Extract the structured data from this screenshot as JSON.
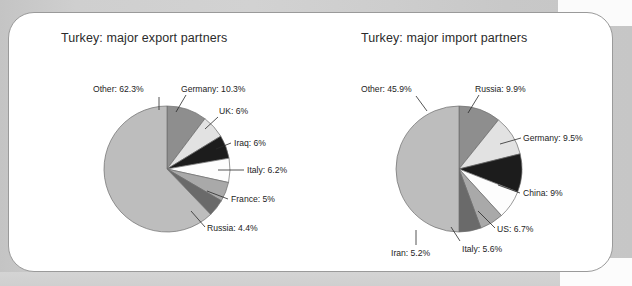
{
  "page": {
    "background_color": "#cdcdcd",
    "card_color": "#ffffff",
    "card_border_color": "#9a9a9a"
  },
  "charts": [
    {
      "id": "export",
      "title": "Turkey: major export partners",
      "chart_data": {
        "type": "pie",
        "title": "Turkey: major export partners",
        "xlabel": "",
        "ylabel": "",
        "legend_position": "callout-labels",
        "grid": false,
        "categories": [
          "Germany",
          "UK",
          "Iraq",
          "Italy",
          "France",
          "Russia",
          "Other"
        ],
        "values": [
          10.3,
          6.0,
          6.0,
          6.2,
          5.0,
          4.4,
          62.3
        ],
        "labels": [
          "Germany: 10.3%",
          "UK: 6%",
          "Iraq: 6%",
          "Italy: 6.2%",
          "France: 5%",
          "Russia: 4.4%",
          "Other: 62.3%"
        ],
        "colors": [
          "#8e8e8e",
          "#e2e2e2",
          "#1c1c1c",
          "#fdfdfd",
          "#a9a9a9",
          "#6a6a6a",
          "#bdbdbd"
        ]
      }
    },
    {
      "id": "import",
      "title": "Turkey: major import partners",
      "chart_data": {
        "type": "pie",
        "title": "Turkey: major import partners",
        "xlabel": "",
        "ylabel": "",
        "legend_position": "callout-labels",
        "grid": false,
        "categories": [
          "Russia",
          "Germany",
          "China",
          "US",
          "Italy",
          "Iran",
          "Other"
        ],
        "values": [
          9.9,
          9.5,
          9.0,
          6.7,
          5.6,
          5.2,
          45.9
        ],
        "labels": [
          "Russia: 9.9%",
          "Germany: 9.5%",
          "China: 9%",
          "US: 6.7%",
          "Italy: 5.6%",
          "Iran: 5.2%",
          "Other: 45.9%"
        ],
        "colors": [
          "#8e8e8e",
          "#e2e2e2",
          "#1c1c1c",
          "#fdfdfd",
          "#a9a9a9",
          "#6a6a6a",
          "#bdbdbd"
        ]
      }
    }
  ],
  "export_labels": {
    "other": "Other: 62.3%",
    "germany": "Germany: 10.3%",
    "uk": "UK: 6%",
    "iraq": "Iraq: 6%",
    "italy": "Italy: 6.2%",
    "france": "France: 5%",
    "russia": "Russia: 4.4%"
  },
  "import_labels": {
    "other": "Other: 45.9%",
    "russia": "Russia: 9.9%",
    "germany": "Germany: 9.5%",
    "china": "China: 9%",
    "us": "US: 6.7%",
    "italy": "Italy: 5.6%",
    "iran": "Iran: 5.2%"
  }
}
